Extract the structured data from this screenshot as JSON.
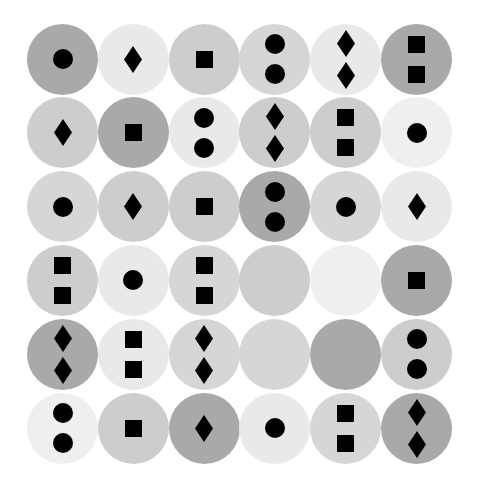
{
  "shades": {
    "dark": "#a9a9a9",
    "medium": "#cdcdcd",
    "medium_light": "#d6d6d6",
    "light": "#e9e9e9",
    "lightest": "#efefef"
  },
  "glyph_color": "#000000",
  "grid": {
    "rows": 6,
    "cols": 6,
    "cells": [
      [
        {
          "shade": "dark",
          "shape": "circle",
          "count": 1
        },
        {
          "shade": "light",
          "shape": "diamond",
          "count": 1
        },
        {
          "shade": "medium",
          "shape": "square",
          "count": 1
        },
        {
          "shade": "medium_light",
          "shape": "circle",
          "count": 2
        },
        {
          "shade": "light",
          "shape": "diamond",
          "count": 2
        },
        {
          "shade": "dark",
          "shape": "square",
          "count": 2
        }
      ],
      [
        {
          "shade": "medium",
          "shape": "diamond",
          "count": 1
        },
        {
          "shade": "dark",
          "shape": "square",
          "count": 1
        },
        {
          "shade": "light",
          "shape": "circle",
          "count": 2
        },
        {
          "shade": "medium",
          "shape": "diamond",
          "count": 2
        },
        {
          "shade": "medium",
          "shape": "square",
          "count": 2
        },
        {
          "shade": "lightest",
          "shape": "circle",
          "count": 1
        }
      ],
      [
        {
          "shade": "medium_light",
          "shape": "circle",
          "count": 1
        },
        {
          "shade": "medium",
          "shape": "diamond",
          "count": 1
        },
        {
          "shade": "medium",
          "shape": "square",
          "count": 1
        },
        {
          "shade": "dark",
          "shape": "circle",
          "count": 2
        },
        {
          "shade": "medium_light",
          "shape": "circle",
          "count": 1
        },
        {
          "shade": "light",
          "shape": "diamond",
          "count": 1
        }
      ],
      [
        {
          "shade": "medium",
          "shape": "square",
          "count": 2
        },
        {
          "shade": "light",
          "shape": "circle",
          "count": 1
        },
        {
          "shade": "medium_light",
          "shape": "square",
          "count": 2
        },
        {
          "shade": "medium",
          "shape": "none",
          "count": 0
        },
        {
          "shade": "lightest",
          "shape": "none",
          "count": 0
        },
        {
          "shade": "dark",
          "shape": "square",
          "count": 1
        }
      ],
      [
        {
          "shade": "dark",
          "shape": "diamond",
          "count": 2
        },
        {
          "shade": "light",
          "shape": "square",
          "count": 2
        },
        {
          "shade": "medium_light",
          "shape": "diamond",
          "count": 2
        },
        {
          "shade": "medium_light",
          "shape": "none",
          "count": 0
        },
        {
          "shade": "dark",
          "shape": "none",
          "count": 0
        },
        {
          "shade": "medium",
          "shape": "circle",
          "count": 2
        }
      ],
      [
        {
          "shade": "lightest",
          "shape": "circle",
          "count": 2
        },
        {
          "shade": "medium",
          "shape": "square",
          "count": 1
        },
        {
          "shade": "dark",
          "shape": "diamond",
          "count": 1
        },
        {
          "shade": "light",
          "shape": "circle",
          "count": 1
        },
        {
          "shade": "medium_light",
          "shape": "square",
          "count": 2
        },
        {
          "shade": "dark",
          "shape": "diamond",
          "count": 2
        }
      ]
    ]
  }
}
